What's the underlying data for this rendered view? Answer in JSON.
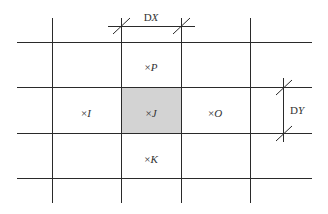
{
  "diagram": {
    "colors": {
      "line": "#2a2a2a",
      "highlight_fill": "#d3d3d3",
      "text": "#333333"
    },
    "grid": {
      "vertical_lines_x": [
        52,
        121,
        181,
        250
      ],
      "horizontal_lines_y": [
        42,
        87,
        133,
        178
      ],
      "h_extent": [
        17,
        312
      ],
      "v_extent": [
        18,
        203
      ]
    },
    "highlighted_cell": "J",
    "cells": [
      {
        "id": "P",
        "marker": "×",
        "label": "P",
        "x": 151,
        "y": 67
      },
      {
        "id": "I",
        "marker": "×",
        "label": "I",
        "x": 86,
        "y": 113
      },
      {
        "id": "J",
        "marker": "×",
        "label": "J",
        "x": 151,
        "y": 113
      },
      {
        "id": "O",
        "marker": "×",
        "label": "O",
        "x": 215,
        "y": 113
      },
      {
        "id": "K",
        "marker": "×",
        "label": "K",
        "x": 151,
        "y": 159
      }
    ],
    "dimensions": {
      "dx": {
        "prefix": "D",
        "var": "X"
      },
      "dy": {
        "prefix": "D",
        "var": "Y"
      }
    }
  }
}
